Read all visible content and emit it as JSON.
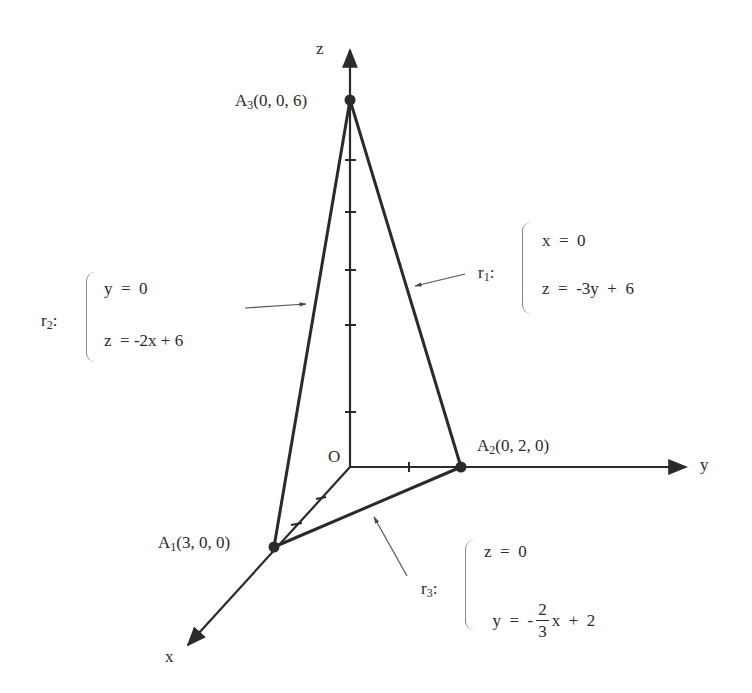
{
  "axes": {
    "x_label": "x",
    "y_label": "y",
    "z_label": "z",
    "origin_label": "O"
  },
  "points": {
    "A1": {
      "name": "A",
      "sub": "1",
      "coords": "(3, 0, 0)"
    },
    "A2": {
      "name": "A",
      "sub": "2",
      "coords": "(0, 2, 0)"
    },
    "A3": {
      "name": "A",
      "sub": "3",
      "coords": "(0, 0, 6)"
    }
  },
  "lines": {
    "r1": {
      "name": "r",
      "sub": "1",
      "colon": ":",
      "eq1": "x  =  0",
      "eq2": "z  =  -3y  +  6"
    },
    "r2": {
      "name": "r",
      "sub": "2",
      "colon": ":",
      "eq1": "y  =  0",
      "eq2": "z  = -2x + 6"
    },
    "r3": {
      "name": "r",
      "sub": "3",
      "colon": ":",
      "eq1": "z  =  0",
      "eq2_lhs": "y  =  -",
      "eq2_num": "2",
      "eq2_den": "3",
      "eq2_rhs": "x  +  2"
    }
  },
  "ticks": {
    "z_axis_count": 5,
    "y_axis_count": 1,
    "x_axis_count": 2
  },
  "colors": {
    "ink": "#2a2a2a",
    "background": "#ffffff",
    "pointer": "#555555"
  }
}
